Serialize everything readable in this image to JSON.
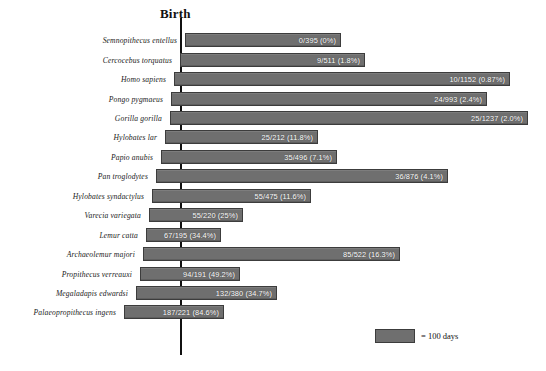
{
  "chart_data": {
    "type": "bar",
    "title": "Birth",
    "xlabel": "",
    "ylabel": "",
    "grid": false,
    "legend_position": "bottom-right",
    "legend_label": "= 100 days",
    "legend_unit_days": 100,
    "axis_marker_label": "Birth",
    "note": "Floating (gestation-to-eruption) bars aligned on a vertical Birth axis; bar left edge = conception (gestation length before birth), bar right edge = age at first molar eruption. Value labels show infant deaths / total sample (percent).",
    "categories": [
      "Semnopithecus entellus",
      "Cercocebus torquatus",
      "Homo sapiens",
      "Pongo pygmaeus",
      "Gorilla gorilla",
      "Hylobates lar",
      "Papio anubis",
      "Pan troglodytes",
      "Hylobates syndactylus",
      "Varecia variegata",
      "Lemur catta",
      "Archaeolemur majori",
      "Propithecus verreauxi",
      "Megaladapis edwardsi",
      "Palaeopropithecus ingens"
    ],
    "value_labels": [
      "0/395 (0%)",
      "9/511 (1.8%)",
      "10/1152 (0.87%)",
      "24/993 (2.4%)",
      "25/1237 (2.0%)",
      "25/212 (11.8%)",
      "35/496 (7.1%)",
      "36/876 (4.1%)",
      "55/475 (11.6%)",
      "55/220 (25%)",
      "67/195 (34.4%)",
      "85/522 (16.3%)",
      "94/191 (49.2%)",
      "132/380 (34.7%)",
      "187/221 (84.6%)"
    ],
    "values": [
      {
        "label": "0/395 (0%)",
        "deaths": 0,
        "total": 395,
        "percent": 0
      },
      {
        "label": "9/511 (1.8%)",
        "deaths": 9,
        "total": 511,
        "percent": 1.8
      },
      {
        "label": "10/1152 (0.87%)",
        "deaths": 10,
        "total": 1152,
        "percent": 0.87
      },
      {
        "label": "24/993 (2.4%)",
        "deaths": 24,
        "total": 993,
        "percent": 2.4
      },
      {
        "label": "25/1237 (2.0%)",
        "deaths": 25,
        "total": 1237,
        "percent": 2.0
      },
      {
        "label": "25/212 (11.8%)",
        "deaths": 25,
        "total": 212,
        "percent": 11.8
      },
      {
        "label": "35/496 (7.1%)",
        "deaths": 35,
        "total": 496,
        "percent": 7.1
      },
      {
        "label": "36/876 (4.1%)",
        "deaths": 36,
        "total": 876,
        "percent": 4.1
      },
      {
        "label": "55/475 (11.6%)",
        "deaths": 55,
        "total": 475,
        "percent": 11.6
      },
      {
        "label": "55/220 (25%)",
        "deaths": 55,
        "total": 220,
        "percent": 25
      },
      {
        "label": "67/195 (34.4%)",
        "deaths": 67,
        "total": 195,
        "percent": 34.4
      },
      {
        "label": "85/522 (16.3%)",
        "deaths": 85,
        "total": 522,
        "percent": 16.3
      },
      {
        "label": "94/191 (49.2%)",
        "deaths": 94,
        "total": 191,
        "percent": 49.2
      },
      {
        "label": "132/380 (34.7%)",
        "deaths": 132,
        "total": 380,
        "percent": 34.7
      },
      {
        "label": "187/221 (84.6%)",
        "deaths": 187,
        "total": 221,
        "percent": 84.6
      }
    ],
    "bars_px": [
      {
        "left": 185,
        "right": 341
      },
      {
        "left": 180,
        "right": 365
      },
      {
        "left": 174,
        "right": 510
      },
      {
        "left": 171,
        "right": 487
      },
      {
        "left": 170,
        "right": 528
      },
      {
        "left": 165,
        "right": 318
      },
      {
        "left": 161,
        "right": 337
      },
      {
        "left": 156,
        "right": 448
      },
      {
        "left": 152,
        "right": 311
      },
      {
        "left": 149,
        "right": 243
      },
      {
        "left": 146,
        "right": 221
      },
      {
        "left": 143,
        "right": 400
      },
      {
        "left": 140,
        "right": 240
      },
      {
        "left": 136,
        "right": 277
      },
      {
        "left": 124,
        "right": 224
      }
    ],
    "axis_px": {
      "x": 180,
      "top": 18,
      "bottom": 355
    },
    "colors": {
      "bar_fill": "#6f6f6f",
      "bar_border": "#3c3c3c",
      "axis": "#111111",
      "value_text": "#ffffff",
      "label_text": "#1a1a1a",
      "background": "#ffffff"
    }
  }
}
